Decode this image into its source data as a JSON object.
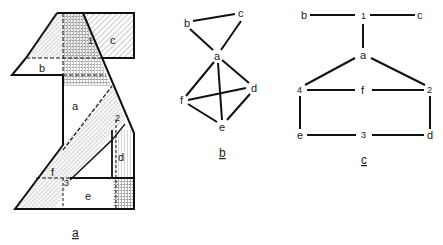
{
  "figure": {
    "panel_a": {
      "caption": "a",
      "regions": [
        "a",
        "b",
        "c",
        "d",
        "e",
        "f"
      ],
      "numbered_regions": [
        "1",
        "2",
        "3"
      ]
    },
    "panel_b": {
      "caption": "b",
      "nodes": [
        {
          "id": "a",
          "label": "a",
          "x": 217,
          "y": 56
        },
        {
          "id": "b",
          "label": "b",
          "x": 187,
          "y": 23
        },
        {
          "id": "c",
          "label": "c",
          "x": 241,
          "y": 13
        },
        {
          "id": "d",
          "label": "d",
          "x": 254,
          "y": 88
        },
        {
          "id": "e",
          "label": "e",
          "x": 222,
          "y": 127
        },
        {
          "id": "f",
          "label": "f",
          "x": 182,
          "y": 100
        }
      ],
      "edges": [
        [
          "b",
          "c"
        ],
        [
          "b",
          "a"
        ],
        [
          "c",
          "a"
        ],
        [
          "a",
          "f"
        ],
        [
          "a",
          "e"
        ],
        [
          "a",
          "d"
        ],
        [
          "f",
          "d"
        ],
        [
          "f",
          "e"
        ],
        [
          "d",
          "e"
        ]
      ]
    },
    "panel_c": {
      "caption": "c",
      "nodes": [
        {
          "id": "b",
          "label": "b"
        },
        {
          "id": "1",
          "label": "1"
        },
        {
          "id": "c",
          "label": "c"
        },
        {
          "id": "a",
          "label": "a"
        },
        {
          "id": "4",
          "label": "4"
        },
        {
          "id": "f",
          "label": "f"
        },
        {
          "id": "2",
          "label": "2"
        },
        {
          "id": "e",
          "label": "e"
        },
        {
          "id": "3",
          "label": "3"
        },
        {
          "id": "d",
          "label": "d"
        }
      ],
      "edges": [
        [
          "b",
          "1"
        ],
        [
          "1",
          "c"
        ],
        [
          "1",
          "a"
        ],
        [
          "a",
          "4"
        ],
        [
          "a",
          "2"
        ],
        [
          "4",
          "f"
        ],
        [
          "f",
          "2"
        ],
        [
          "4",
          "e"
        ],
        [
          "2",
          "d"
        ],
        [
          "e",
          "3"
        ],
        [
          "3",
          "d"
        ]
      ]
    }
  }
}
